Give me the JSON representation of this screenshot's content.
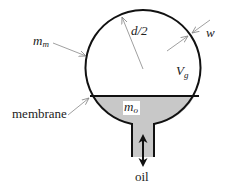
{
  "diagram": {
    "type": "accumulator-schematic",
    "colors": {
      "outline": "#111111",
      "oil_fill": "#c8c8c8",
      "leader_line": "#888888",
      "background": "#ffffff"
    },
    "labels": {
      "membrane_mass": {
        "base": "m",
        "sub": "m"
      },
      "radius": "d/2",
      "wall_thickness": "w",
      "gas_volume": {
        "base": "V",
        "sub": "g"
      },
      "oil_mass": {
        "base": "m",
        "sub": "o"
      },
      "membrane": "membrane",
      "oil": "oil"
    }
  }
}
